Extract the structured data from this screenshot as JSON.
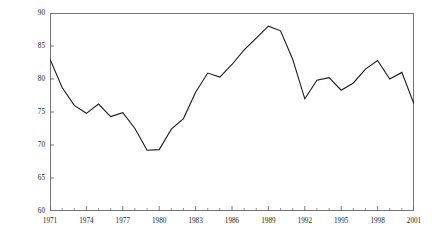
{
  "chart_data": {
    "type": "line",
    "title": "",
    "xlabel": "",
    "ylabel": "Support for Pro-Environment Policies (Percent)",
    "xlim": [
      1971,
      2001
    ],
    "ylim": [
      60,
      90
    ],
    "grid": false,
    "legend": "none",
    "y_ticks": [
      60,
      65,
      70,
      75,
      80,
      85,
      90
    ],
    "y_tick_labels": [
      "60",
      "65",
      "70",
      "75",
      "80",
      "85",
      "90"
    ],
    "x_ticks": [
      1971,
      1974,
      1977,
      1980,
      1983,
      1986,
      1989,
      1992,
      1995,
      1998,
      2001
    ],
    "x_tick_labels": [
      "1971",
      "1974",
      "1977",
      "1980",
      "1983",
      "1986",
      "1989",
      "1992",
      "1995",
      "1998",
      "2001"
    ],
    "x_minor_tick_interval": 1,
    "line_color": "#1a1a1a",
    "line_width": 1.1,
    "x": [
      1971,
      1972,
      1973,
      1974,
      1975,
      1976,
      1977,
      1978,
      1979,
      1980,
      1981,
      1982,
      1983,
      1984,
      1985,
      1986,
      1987,
      1988,
      1989,
      1990,
      1991,
      1992,
      1993,
      1994,
      1995,
      1996,
      1997,
      1998,
      1999,
      2000,
      2001
    ],
    "values": [
      83.0,
      78.7,
      76.0,
      74.8,
      76.2,
      74.3,
      74.9,
      72.5,
      69.2,
      69.3,
      72.4,
      74.0,
      78.0,
      80.9,
      80.3,
      82.2,
      84.4,
      86.2,
      88.0,
      87.3,
      83.0,
      77.0,
      79.8,
      80.2,
      78.3,
      79.4,
      81.5,
      82.8,
      80.0,
      81.0,
      76.2
    ],
    "series": [
      {
        "name": "Support for Pro-Environment Policies",
        "values": [
          83.0,
          78.7,
          76.0,
          74.8,
          76.2,
          74.3,
          74.9,
          72.5,
          69.2,
          69.3,
          72.4,
          74.0,
          78.0,
          80.9,
          80.3,
          82.2,
          84.4,
          86.2,
          88.0,
          87.3,
          83.0,
          77.0,
          79.8,
          80.2,
          78.3,
          79.4,
          81.5,
          82.8,
          80.0,
          81.0,
          76.2
        ]
      }
    ],
    "annotations": []
  }
}
